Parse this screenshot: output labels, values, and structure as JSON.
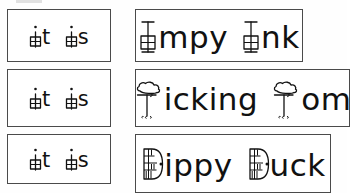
{
  "worksheet": {
    "title": "Letter i word cards worksheet",
    "background_color": "#ffffff",
    "ink_color": "#111111",
    "border_color": "#4a4a4a",
    "columns": 2,
    "rows": 3
  },
  "cards": [
    {
      "id": "row1-left",
      "column": "left",
      "row": 1,
      "text": "it is",
      "words": [
        "it",
        "is"
      ],
      "decorated_letters": [
        "i",
        "i"
      ],
      "decoration": "window-icon"
    },
    {
      "id": "row1-right",
      "column": "right",
      "row": 1,
      "text": "Impy Ink",
      "words": [
        "Impy",
        "Ink"
      ],
      "decorated_letters": [
        "I",
        "I"
      ],
      "decoration": "window-icon",
      "word1_rest": "mpy",
      "word2_rest": "nk"
    },
    {
      "id": "row2-left",
      "column": "left",
      "row": 2,
      "text": "it is",
      "words": [
        "it",
        "is"
      ],
      "decorated_letters": [
        "i",
        "i"
      ],
      "decoration": "window-icon"
    },
    {
      "id": "row2-right",
      "column": "right",
      "row": 2,
      "text": "Ticking Tom",
      "words": [
        "Ticking",
        "Tom"
      ],
      "decorated_letters": [
        "T",
        "T"
      ],
      "decoration": "tree-icon",
      "word1_rest": "icking",
      "word2_rest": "om"
    },
    {
      "id": "row3-left",
      "column": "left",
      "row": 3,
      "text": "it is",
      "words": [
        "it",
        "is"
      ],
      "decorated_letters": [
        "i",
        "i"
      ],
      "decoration": "window-icon"
    },
    {
      "id": "row3-right",
      "column": "right",
      "row": 3,
      "text": "Dippy Duck",
      "words": [
        "Dippy",
        "Duck"
      ],
      "decorated_letters": [
        "D",
        "D"
      ],
      "decoration": "door-icon",
      "word1_rest": "ippy",
      "word2_rest": "uck"
    }
  ],
  "letter_fragments": {
    "it_rest": "t",
    "is_rest": "s",
    "empty": ""
  }
}
